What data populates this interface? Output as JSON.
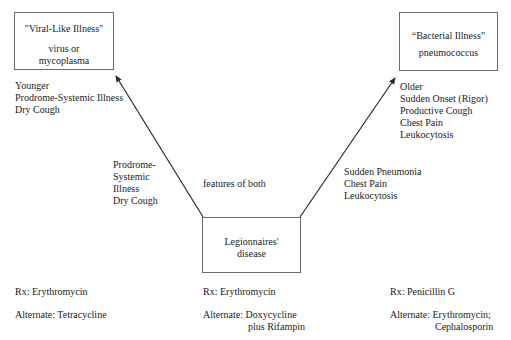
{
  "diagram": {
    "viral_box": {
      "title": "\"Viral-Like Illness\"",
      "sub_lines": [
        "virus or",
        "mycoplasma"
      ]
    },
    "bacterial_box": {
      "title": "“Bacterial Illness”",
      "sub_lines": [
        "pneumococcus"
      ]
    },
    "legionnaires_box": {
      "lines": [
        "Legionnaires'",
        "disease"
      ]
    },
    "viral_features": [
      "Younger",
      "Prodrome-Systemic Illness",
      "Dry Cough"
    ],
    "bacterial_features": [
      "Older",
      "Sudden Onset (Rigor)",
      "Productive Cough",
      "Chest Pain",
      "Leukocytosis"
    ],
    "left_arrow_label": [
      "Prodrome-",
      "Systemic",
      "Illness",
      "Dry Cough"
    ],
    "center_label": "features of both",
    "right_arrow_label": [
      "Sudden Pneumonia",
      "Chest Pain",
      "Leukocytosis"
    ],
    "treatments": {
      "viral": {
        "rx": "Rx: Erythromycin",
        "alternate": [
          "Alternate: Tetracycline"
        ]
      },
      "legionnaires": {
        "rx": "Rx: Erythromycin",
        "alternate": [
          "Alternate: Doxycycline",
          "plus Rifampin"
        ]
      },
      "bacterial": {
        "rx": "Rx: Penicillin G",
        "alternate": [
          "Alternate: Erythromycin;",
          "Cephalosporin"
        ]
      }
    },
    "colors": {
      "line": "#2a2a2a",
      "box_border": "#6a6a6a",
      "text": "#1a1a1a"
    }
  }
}
